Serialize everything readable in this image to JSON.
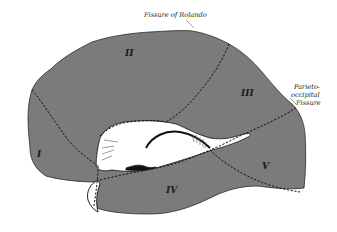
{
  "figure": {
    "fill_color": "#7b7b7b",
    "line_color": "#111111",
    "background": "#ffffff"
  },
  "labels": {
    "fissure_rolando": "Fissure of Rolando",
    "parieto_occipital": {
      "line1": "Parieto-",
      "line2": "occipital",
      "line3": "Fissure"
    }
  },
  "regions": [
    {
      "id": "I",
      "label": "I"
    },
    {
      "id": "II",
      "label": "II"
    },
    {
      "id": "III",
      "label": "III"
    },
    {
      "id": "IV",
      "label": "IV"
    },
    {
      "id": "V",
      "label": "V"
    }
  ]
}
